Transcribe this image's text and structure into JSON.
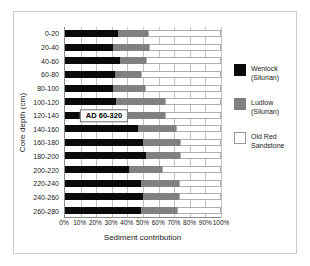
{
  "chart_data": {
    "type": "bar",
    "orientation": "horizontal",
    "stacked": true,
    "title": "",
    "xlabel": "Sediment contribution",
    "ylabel": "Core depth (cm)",
    "xlim": [
      0,
      100
    ],
    "grid": true,
    "legend_position": "right",
    "xticks": [
      "0%",
      "10%",
      "20%",
      "30%",
      "40%",
      "50%",
      "60%",
      "70%",
      "80%",
      "90%",
      "100%"
    ],
    "xtick_values": [
      0,
      10,
      20,
      30,
      40,
      50,
      60,
      70,
      80,
      90,
      100
    ],
    "categories": [
      "0-20",
      "20-40",
      "40-60",
      "60-80",
      "80-100",
      "100-120",
      "120-140",
      "140-160",
      "160-180",
      "180-200",
      "200-220",
      "220-240",
      "240-260",
      "260-280"
    ],
    "series": [
      {
        "name": "Wenlock (Silurian)",
        "color": "#0a0a0a",
        "values": [
          34,
          31,
          35,
          32,
          31,
          33,
          36,
          47,
          50,
          52,
          41,
          49,
          50,
          49
        ]
      },
      {
        "name": "Ludlow (Silurian)",
        "color": "#808080",
        "values": [
          19,
          23,
          17,
          17,
          20,
          31,
          28,
          24,
          24,
          22,
          21,
          24,
          23,
          23
        ]
      },
      {
        "name": "Old Red Sandstone",
        "color": "#ffffff",
        "values": [
          47,
          46,
          48,
          51,
          49,
          36,
          36,
          29,
          26,
          26,
          38,
          27,
          27,
          28
        ]
      }
    ],
    "annotations": [
      {
        "text": "AD 60-320",
        "category": "120-140",
        "x_center_pct": 25
      }
    ]
  },
  "legend": {
    "entries": [
      {
        "label_line1": "Wenlock",
        "label_line2": "(Silurian)",
        "color": "#0a0a0a"
      },
      {
        "label_line1": "Ludlow",
        "label_line2": "(Silurian)",
        "color": "#808080"
      },
      {
        "label_line1": "Old Red",
        "label_line2": "Sandstone",
        "color": "#ffffff"
      }
    ]
  }
}
